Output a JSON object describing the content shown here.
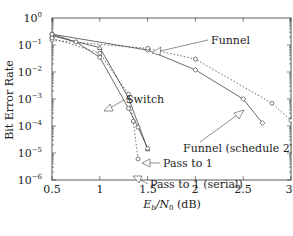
{
  "chart_data": {
    "type": "line",
    "title": "",
    "xlabel": "E_b/N_0 (dB)",
    "ylabel": "Bit Error Rate",
    "xlim": [
      0.5,
      3
    ],
    "ylim": [
      1e-06,
      1
    ],
    "yscale": "log",
    "grid": false,
    "x_ticks": [
      0.5,
      1,
      1.5,
      2,
      2.5,
      3
    ],
    "x_tick_labels": [
      "0.5",
      "1",
      "1.5",
      "2",
      "2.5",
      "3"
    ],
    "y_ticks_exp": [
      0,
      -1,
      -2,
      -3,
      -4,
      -5,
      -6
    ],
    "series": [
      {
        "name": "Funnel",
        "style": "solid",
        "marker": "diamond",
        "x": [
          0.5,
          1.5,
          2.0,
          2.5,
          2.7
        ],
        "y": [
          0.25,
          0.065,
          0.012,
          0.001,
          0.00013
        ]
      },
      {
        "name": "Funnel (schedule 2)",
        "style": "dotted",
        "marker": "circle",
        "x": [
          0.5,
          1.5,
          2.0,
          2.8,
          3.0
        ],
        "y": [
          0.15,
          0.075,
          0.03,
          0.0007,
          0.00016
        ]
      },
      {
        "name": "Switch",
        "style": "solid",
        "marker": "triangle",
        "x": [
          0.5,
          1.0,
          1.3,
          1.5
        ],
        "y": [
          0.22,
          0.08,
          0.0011,
          1.4e-05
        ]
      },
      {
        "name": "Pass to 1",
        "style": "solid",
        "marker": "circle",
        "x": [
          0.5,
          0.75,
          1.0,
          1.3,
          1.4,
          1.5
        ],
        "y": [
          0.25,
          0.13,
          0.035,
          0.00045,
          9e-05,
          1.5e-05
        ]
      },
      {
        "name": "Pass to 1 (serial)",
        "style": "dotted",
        "marker": "circle",
        "x": [
          0.5,
          1.0,
          1.3,
          1.35,
          1.4
        ],
        "y": [
          0.18,
          0.05,
          0.0015,
          0.00015,
          6e-06
        ]
      }
    ],
    "annotations": [
      {
        "text": "Funnel",
        "x": 2.05,
        "y": 0.12
      },
      {
        "text": "Switch",
        "x": 1.42,
        "y": 0.0018
      },
      {
        "text": "Funnel (schedule 2)",
        "x": 1.8,
        "y": 5e-05
      },
      {
        "text": "Pass to 1",
        "x": 1.65,
        "y": 1.5e-05
      },
      {
        "text": "Pass to 1 (serial)",
        "x": 1.55,
        "y": 3.5e-06
      }
    ]
  },
  "labels": {
    "ylabel": "Bit Error Rate",
    "xlabel_main": "E",
    "xlabel_sub1": "b",
    "xlabel_mid": "/N",
    "xlabel_sub2": "0",
    "xlabel_unit": " (dB)",
    "ann_funnel": "Funnel",
    "ann_switch": "Switch",
    "ann_funnel2": "Funnel (schedule 2)",
    "ann_pass": "Pass to 1",
    "ann_pass_serial": "Pass to 1 (serial)",
    "xt0": "0.5",
    "xt1": "1",
    "xt2": "1.5",
    "xt3": "2",
    "xt4": "2.5",
    "xt5": "3",
    "ybase": "10",
    "ye0": "0",
    "ye1": "−1",
    "ye2": "−2",
    "ye3": "−3",
    "ye4": "−4",
    "ye5": "−5",
    "ye6": "−6"
  },
  "colors": {
    "line": "#444444",
    "axis": "#333333",
    "background": "#ffffff"
  }
}
